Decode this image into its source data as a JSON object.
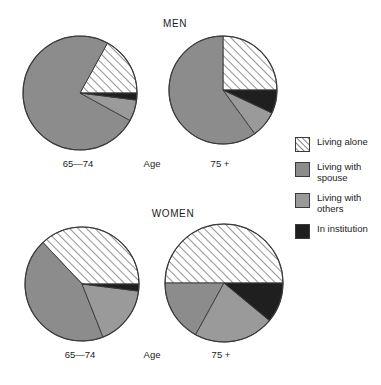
{
  "figure": {
    "background_color": "#ffffff",
    "panels": [
      {
        "id": "men",
        "title": "MEN"
      },
      {
        "id": "women",
        "title": "WOMEN"
      }
    ],
    "axis_label": "Age",
    "group_labels": {
      "young": "65—74",
      "old": "75 +"
    }
  },
  "legend": {
    "position": "right",
    "items": [
      {
        "key": "alone",
        "label": "Living alone",
        "color": "#ffffff",
        "pattern": "diagonal-hatch",
        "icon": "hatched-square-icon"
      },
      {
        "key": "spouse",
        "label": "Living with spouse",
        "color": "#8c8c8c",
        "pattern": "solid",
        "icon": "gray-square-icon"
      },
      {
        "key": "others",
        "label": "Living with others",
        "color": "#9a9a9a",
        "pattern": "solid",
        "icon": "gray-square-icon"
      },
      {
        "key": "institution",
        "label": "In institution",
        "color": "#1f1f1f",
        "pattern": "solid",
        "icon": "black-square-icon"
      }
    ]
  },
  "colors": {
    "alone": "#ffffff",
    "alone_hatch": "#3a3a3a",
    "spouse": "#8c8c8c",
    "others": "#9a9a9a",
    "institution": "#1f1f1f",
    "outline": "#3a3a3a",
    "text": "#1c1c1c"
  },
  "chart_data": {
    "type": "pie",
    "xlabel": "Age",
    "ylabel": "",
    "legend_position": "right",
    "grid": false,
    "categories": [
      "Living alone",
      "Living with spouse",
      "Living with others",
      "In institution"
    ],
    "charts": [
      {
        "panel": "MEN",
        "group": "65—74",
        "start_angle_deg": 0,
        "direction": "counterclockwise",
        "slices": [
          {
            "label": "Living alone",
            "value": 17,
            "unit": "%"
          },
          {
            "label": "Living with spouse",
            "value": 75,
            "unit": "%"
          },
          {
            "label": "Living with others",
            "value": 6,
            "unit": "%"
          },
          {
            "label": "In institution",
            "value": 2,
            "unit": "%"
          }
        ]
      },
      {
        "panel": "MEN",
        "group": "75 +",
        "start_angle_deg": 0,
        "direction": "counterclockwise",
        "slices": [
          {
            "label": "Living alone",
            "value": 25,
            "unit": "%"
          },
          {
            "label": "Living with spouse",
            "value": 60,
            "unit": "%"
          },
          {
            "label": "Living with others",
            "value": 8,
            "unit": "%"
          },
          {
            "label": "In institution",
            "value": 7,
            "unit": "%"
          }
        ]
      },
      {
        "panel": "WOMEN",
        "group": "65—74",
        "start_angle_deg": 0,
        "direction": "counterclockwise",
        "slices": [
          {
            "label": "Living alone",
            "value": 37,
            "unit": "%"
          },
          {
            "label": "Living with spouse",
            "value": 44,
            "unit": "%"
          },
          {
            "label": "Living with others",
            "value": 17,
            "unit": "%"
          },
          {
            "label": "In institution",
            "value": 2,
            "unit": "%"
          }
        ]
      },
      {
        "panel": "WOMEN",
        "group": "75 +",
        "start_angle_deg": 0,
        "direction": "counterclockwise",
        "slices": [
          {
            "label": "Living alone",
            "value": 50,
            "unit": "%"
          },
          {
            "label": "Living with spouse",
            "value": 17,
            "unit": "%"
          },
          {
            "label": "Living with others",
            "value": 22,
            "unit": "%"
          },
          {
            "label": "In institution",
            "value": 11,
            "unit": "%"
          }
        ]
      }
    ]
  },
  "layout": {
    "pies": [
      {
        "chart_index": 0,
        "cx": 78,
        "cy": 91,
        "r": 57
      },
      {
        "chart_index": 1,
        "cx": 221,
        "cy": 88,
        "r": 54
      },
      {
        "chart_index": 2,
        "cx": 80,
        "cy": 282,
        "r": 57
      },
      {
        "chart_index": 3,
        "cx": 222,
        "cy": 281,
        "r": 59
      }
    ],
    "titles": [
      {
        "text_path": "figure.panels.0.title",
        "x": 135,
        "y": 18,
        "w": 80
      },
      {
        "text_path": "figure.panels.1.title",
        "x": 128,
        "y": 208,
        "w": 90
      }
    ],
    "axis_labels": [
      {
        "x": 38,
        "y": 158,
        "w": 80
      },
      {
        "x": 122,
        "y": 158,
        "w": 60
      },
      {
        "x": 185,
        "y": 158,
        "w": 70
      },
      {
        "x": 40,
        "y": 349,
        "w": 80
      },
      {
        "x": 122,
        "y": 349,
        "w": 60
      },
      {
        "x": 186,
        "y": 349,
        "w": 70
      }
    ]
  }
}
